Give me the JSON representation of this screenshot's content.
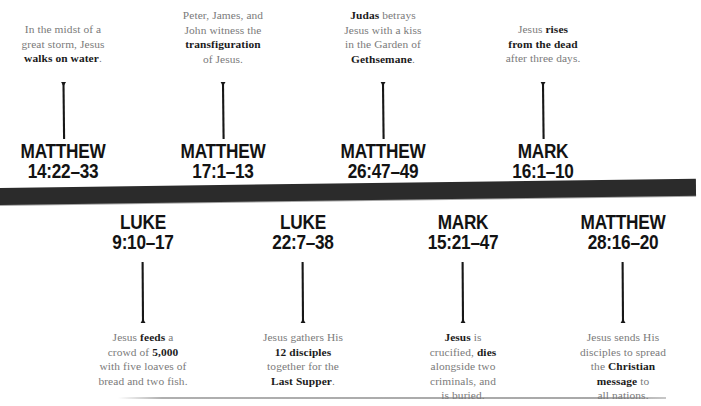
{
  "figure": {
    "type": "timeline",
    "orientation": "horizontal",
    "colors": {
      "bar": "#2b2b2b",
      "reference_text": "#131313",
      "description_text": "#7a7a7a",
      "emphasis_text": "#1b1b1b",
      "background": "#ffffff",
      "bottom_rule": "#a8a8a8"
    }
  },
  "events_above": [
    {
      "reference_book": "MATTHEW",
      "reference_verse": "14:22–33",
      "description_lines": [
        [
          {
            "t": "In the midst of a",
            "b": false
          }
        ],
        [
          {
            "t": "great storm, Jesus",
            "b": false
          }
        ],
        [
          {
            "t": "walks on water",
            "b": true
          },
          {
            "t": ".",
            "b": false
          }
        ]
      ],
      "arrow": "up-arrow-icon"
    },
    {
      "reference_book": "MATTHEW",
      "reference_verse": "17:1–13",
      "description_lines": [
        [
          {
            "t": "Peter, James, and",
            "b": false
          }
        ],
        [
          {
            "t": "John witness the",
            "b": false
          }
        ],
        [
          {
            "t": "transfiguration",
            "b": true
          }
        ],
        [
          {
            "t": "of Jesus.",
            "b": false
          }
        ]
      ],
      "arrow": "up-arrow-icon"
    },
    {
      "reference_book": "MATTHEW",
      "reference_verse": "26:47–49",
      "description_lines": [
        [
          {
            "t": "Judas",
            "b": true
          },
          {
            "t": " betrays",
            "b": false
          }
        ],
        [
          {
            "t": "Jesus with a kiss",
            "b": false
          }
        ],
        [
          {
            "t": "in the Garden of",
            "b": false
          }
        ],
        [
          {
            "t": "Gethsemane",
            "b": true
          },
          {
            "t": ".",
            "b": false
          }
        ]
      ],
      "arrow": "up-arrow-icon"
    },
    {
      "reference_book": "MARK",
      "reference_verse": "16:1–10",
      "description_lines": [
        [
          {
            "t": "Jesus ",
            "b": false
          },
          {
            "t": "rises",
            "b": true
          }
        ],
        [
          {
            "t": "from the dead",
            "b": true
          }
        ],
        [
          {
            "t": "after three days.",
            "b": false
          }
        ]
      ],
      "arrow": "up-arrow-icon"
    }
  ],
  "events_below": [
    {
      "reference_book": "LUKE",
      "reference_verse": "9:10–17",
      "description_lines": [
        [
          {
            "t": "Jesus ",
            "b": false
          },
          {
            "t": "feeds",
            "b": true
          },
          {
            "t": " a",
            "b": false
          }
        ],
        [
          {
            "t": "crowd of ",
            "b": false
          },
          {
            "t": "5,000",
            "b": true
          }
        ],
        [
          {
            "t": "with five loaves of",
            "b": false
          }
        ],
        [
          {
            "t": "bread and two fish.",
            "b": false
          }
        ]
      ],
      "arrow": "down-arrow-icon"
    },
    {
      "reference_book": "LUKE",
      "reference_verse": "22:7–38",
      "description_lines": [
        [
          {
            "t": "Jesus gathers His",
            "b": false
          }
        ],
        [
          {
            "t": "12 disciples",
            "b": true
          }
        ],
        [
          {
            "t": "together for the",
            "b": false
          }
        ],
        [
          {
            "t": "Last Supper",
            "b": true
          },
          {
            "t": ".",
            "b": false
          }
        ]
      ],
      "arrow": "down-arrow-icon"
    },
    {
      "reference_book": "MARK",
      "reference_verse": "15:21–47",
      "description_lines": [
        [
          {
            "t": "Jesus",
            "b": true
          },
          {
            "t": " is",
            "b": false
          }
        ],
        [
          {
            "t": "crucified, ",
            "b": false
          },
          {
            "t": "dies",
            "b": true
          }
        ],
        [
          {
            "t": "alongside two",
            "b": false
          }
        ],
        [
          {
            "t": "criminals, and",
            "b": false
          }
        ],
        [
          {
            "t": "is buried.",
            "b": false
          }
        ]
      ],
      "arrow": "down-arrow-icon"
    },
    {
      "reference_book": "MATTHEW",
      "reference_verse": "28:16–20",
      "description_lines": [
        [
          {
            "t": "Jesus sends His",
            "b": false
          }
        ],
        [
          {
            "t": "disciples to spread",
            "b": false
          }
        ],
        [
          {
            "t": "the ",
            "b": false
          },
          {
            "t": "Christian",
            "b": true
          }
        ],
        [
          {
            "t": "message",
            "b": true
          },
          {
            "t": " to",
            "b": false
          }
        ],
        [
          {
            "t": "all nations.",
            "b": false
          }
        ]
      ],
      "arrow": "down-arrow-icon"
    }
  ],
  "layout": {
    "columns_above_centers": [
      63,
      223,
      383,
      543
    ],
    "columns_below_centers": [
      143,
      303,
      463,
      623
    ]
  }
}
